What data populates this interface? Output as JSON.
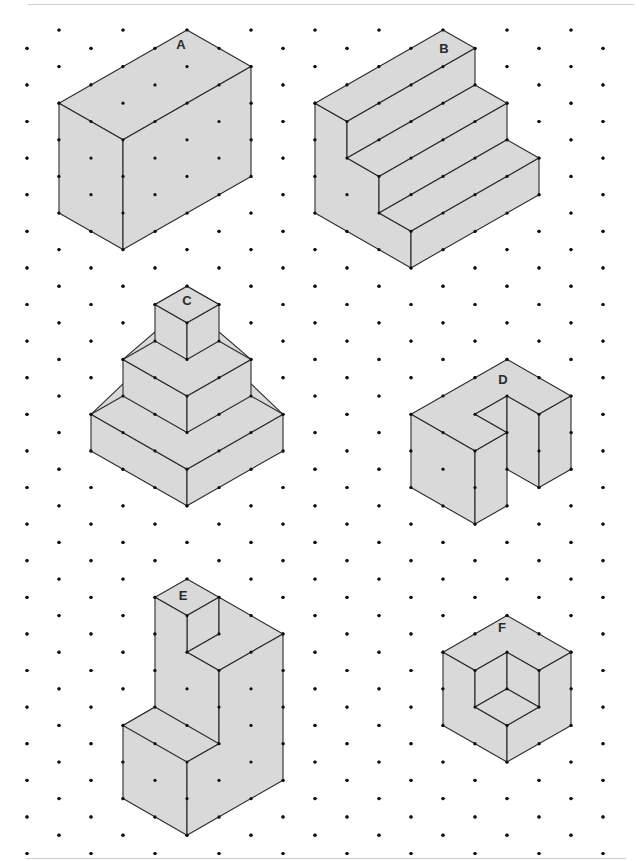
{
  "page": {
    "width": 639,
    "height": 861,
    "colors": {
      "fill": "#d9d9d9",
      "stroke": "#2b2b2b",
      "dot": "#111111",
      "rule": "#cfcfcf"
    }
  },
  "grid": {
    "origin_x": 27,
    "origin_y": 30,
    "col_step": 32,
    "row_step": 18.3,
    "rows": 46,
    "max_x": 610,
    "dot_radius": 1.6
  },
  "shapes": [
    {
      "id": "A",
      "label": "A",
      "label_pos": [
        181,
        46
      ],
      "faces": [
        [
          [
            187,
            0
          ],
          [
            251,
            2
          ],
          [
            123,
            6
          ],
          [
            59,
            4
          ]
        ],
        [
          [
            59,
            4
          ],
          [
            123,
            6
          ],
          [
            123,
            12
          ],
          [
            59,
            10
          ]
        ],
        [
          [
            123,
            6
          ],
          [
            251,
            2
          ],
          [
            251,
            8
          ],
          [
            123,
            12
          ]
        ]
      ]
    },
    {
      "id": "B",
      "label": "B",
      "label_pos": [
        444,
        50
      ],
      "faces": [
        [
          [
            315,
            4
          ],
          [
            347,
            5
          ],
          [
            347,
            7
          ],
          [
            379,
            8
          ],
          [
            379,
            10
          ],
          [
            411,
            11
          ],
          [
            411,
            13
          ],
          [
            315,
            10
          ]
        ],
        [
          [
            315,
            4
          ],
          [
            443,
            0
          ],
          [
            475,
            1
          ],
          [
            347,
            5
          ]
        ],
        [
          [
            347,
            5
          ],
          [
            475,
            1
          ],
          [
            475,
            3
          ],
          [
            347,
            7
          ]
        ],
        [
          [
            347,
            7
          ],
          [
            475,
            3
          ],
          [
            507,
            4
          ],
          [
            379,
            8
          ]
        ],
        [
          [
            379,
            8
          ],
          [
            507,
            4
          ],
          [
            507,
            6
          ],
          [
            379,
            10
          ]
        ],
        [
          [
            379,
            10
          ],
          [
            507,
            6
          ],
          [
            539,
            7
          ],
          [
            411,
            11
          ]
        ],
        [
          [
            411,
            11
          ],
          [
            539,
            7
          ],
          [
            539,
            9
          ],
          [
            411,
            13
          ]
        ]
      ]
    },
    {
      "id": "C",
      "label": "C",
      "label_pos": [
        187,
        302
      ],
      "faces": [
        [
          [
            91,
            21
          ],
          [
            187,
            16
          ],
          [
            283,
            21
          ],
          [
            187,
            26
          ]
        ],
        [
          [
            91,
            21
          ],
          [
            187,
            24
          ],
          [
            187,
            26
          ],
          [
            91,
            23
          ]
        ],
        [
          [
            187,
            24
          ],
          [
            283,
            21
          ],
          [
            283,
            23
          ],
          [
            187,
            26
          ]
        ],
        [
          [
            91,
            21
          ],
          [
            187,
            24
          ],
          [
            283,
            21
          ],
          [
            187,
            18
          ]
        ],
        [
          [
            123,
            18
          ],
          [
            187,
            15
          ],
          [
            251,
            18
          ],
          [
            187,
            22
          ]
        ],
        [
          [
            123,
            18
          ],
          [
            187,
            20
          ],
          [
            187,
            22
          ],
          [
            123,
            20
          ]
        ],
        [
          [
            187,
            20
          ],
          [
            251,
            18
          ],
          [
            251,
            20
          ],
          [
            187,
            22
          ]
        ],
        [
          [
            123,
            18
          ],
          [
            187,
            20
          ],
          [
            251,
            18
          ],
          [
            187,
            16
          ]
        ],
        [
          [
            155,
            15
          ],
          [
            187,
            14
          ],
          [
            219,
            15
          ],
          [
            187,
            16
          ]
        ],
        [
          [
            155,
            15
          ],
          [
            187,
            16
          ],
          [
            187,
            18
          ],
          [
            155,
            17
          ]
        ],
        [
          [
            187,
            16
          ],
          [
            219,
            15
          ],
          [
            219,
            17
          ],
          [
            187,
            18
          ]
        ],
        [
          [
            155,
            15
          ],
          [
            187,
            14
          ],
          [
            219,
            15
          ],
          [
            187,
            16
          ]
        ]
      ]
    },
    {
      "id": "D",
      "label": "D",
      "label_pos": [
        503,
        381
      ],
      "faces": [
        [
          [
            411,
            21
          ],
          [
            507,
            18
          ],
          [
            571,
            20
          ],
          [
            539,
            21
          ],
          [
            507,
            20
          ],
          [
            475,
            21
          ],
          [
            507,
            22
          ],
          [
            475,
            23
          ]
        ],
        [
          [
            411,
            21
          ],
          [
            475,
            23
          ],
          [
            475,
            27
          ],
          [
            411,
            25
          ]
        ],
        [
          [
            475,
            23
          ],
          [
            507,
            22
          ],
          [
            507,
            26
          ],
          [
            475,
            27
          ]
        ],
        [
          [
            475,
            21
          ],
          [
            507,
            20
          ],
          [
            507,
            22
          ]
        ],
        [
          [
            507,
            20
          ],
          [
            539,
            21
          ],
          [
            539,
            25
          ],
          [
            507,
            24
          ]
        ],
        [
          [
            539,
            21
          ],
          [
            571,
            20
          ],
          [
            571,
            24
          ],
          [
            539,
            25
          ]
        ]
      ]
    },
    {
      "id": "E",
      "label": "E",
      "label_pos": [
        183,
        597
      ],
      "faces": [
        [
          [
            155,
            31
          ],
          [
            187,
            30
          ],
          [
            219,
            31
          ],
          [
            187,
            32
          ]
        ],
        [
          [
            187,
            32
          ],
          [
            219,
            31
          ],
          [
            219,
            33
          ],
          [
            187,
            34
          ]
        ],
        [
          [
            219,
            31
          ],
          [
            283,
            33
          ],
          [
            219,
            35
          ],
          [
            187,
            34
          ],
          [
            219,
            33
          ]
        ],
        [
          [
            155,
            31
          ],
          [
            187,
            32
          ],
          [
            187,
            34
          ],
          [
            219,
            35
          ],
          [
            219,
            39
          ],
          [
            187,
            40
          ],
          [
            187,
            44
          ],
          [
            123,
            42
          ],
          [
            123,
            38
          ],
          [
            155,
            37
          ]
        ],
        [
          [
            123,
            38
          ],
          [
            155,
            37
          ],
          [
            219,
            39
          ],
          [
            187,
            40
          ]
        ],
        [
          [
            219,
            35
          ],
          [
            283,
            33
          ],
          [
            283,
            41
          ],
          [
            187,
            44
          ],
          [
            187,
            40
          ],
          [
            219,
            39
          ]
        ]
      ]
    },
    {
      "id": "F",
      "label": "F",
      "label_pos": [
        502,
        629
      ],
      "faces": [
        [
          [
            443,
            34
          ],
          [
            507,
            32
          ],
          [
            571,
            34
          ],
          [
            539,
            35
          ],
          [
            507,
            34
          ],
          [
            475,
            35
          ]
        ],
        [
          [
            443,
            34
          ],
          [
            475,
            35
          ],
          [
            475,
            37
          ],
          [
            507,
            38
          ],
          [
            507,
            40
          ],
          [
            443,
            38
          ]
        ],
        [
          [
            571,
            34
          ],
          [
            571,
            38
          ],
          [
            507,
            40
          ],
          [
            507,
            38
          ],
          [
            539,
            37
          ],
          [
            539,
            35
          ]
        ],
        [
          [
            475,
            35
          ],
          [
            507,
            34
          ],
          [
            507,
            36
          ],
          [
            475,
            37
          ]
        ],
        [
          [
            507,
            34
          ],
          [
            539,
            35
          ],
          [
            539,
            37
          ],
          [
            507,
            36
          ]
        ],
        [
          [
            475,
            37
          ],
          [
            507,
            36
          ],
          [
            539,
            37
          ],
          [
            507,
            38
          ]
        ]
      ]
    }
  ]
}
